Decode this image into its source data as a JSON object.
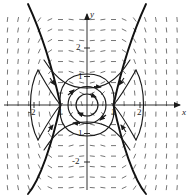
{
  "figure": {
    "width": 195,
    "height": 196,
    "background": "#ffffff",
    "ink_color": "#1a1a1a",
    "field_color": "#555555"
  },
  "axes": {
    "x_axis_label": "x",
    "y_axis_label": "y",
    "origin_px": [
      87,
      105
    ],
    "unit_px_x": 26.5,
    "unit_px_y": 28.5,
    "xlim": [
      -3.2,
      3.7
    ],
    "ylim": [
      -3.1,
      3.2
    ],
    "x_ticks": [
      {
        "value": -2,
        "label": "-2"
      },
      {
        "value": -1,
        "label": "1"
      },
      {
        "value": 1,
        "label": "1"
      },
      {
        "value": 2,
        "label": "2"
      }
    ],
    "y_ticks": [
      {
        "value": 2,
        "label": "2"
      },
      {
        "value": 1,
        "label": "1"
      },
      {
        "value": -1,
        "label": "1"
      },
      {
        "value": -2,
        "label": "-2"
      }
    ],
    "x_arrow": "right",
    "y_arrow": "up"
  },
  "chart_data": {
    "type": "scatter",
    "title": "",
    "xlabel": "x",
    "ylabel": "y",
    "xlim": [
      -3.2,
      3.7
    ],
    "ylim": [
      -3.1,
      3.2
    ],
    "grid": false,
    "legend": null,
    "plot_kind": "phase-portrait-direction-field",
    "equilibria": [
      {
        "point": [
          0,
          0
        ],
        "type": "center"
      },
      {
        "point": [
          -1,
          0
        ],
        "type": "saddle"
      },
      {
        "point": [
          1,
          0
        ],
        "type": "saddle"
      }
    ],
    "closed_orbits": [
      {
        "name": "inner-orbit",
        "rx": 0.42,
        "ry": 0.4,
        "direction": "clockwise"
      },
      {
        "name": "middle-orbit",
        "rx": 0.72,
        "ry": 0.66,
        "direction": "clockwise"
      }
    ],
    "separatrix": {
      "name": "homoclinic-loop-and-branches",
      "stroke_width": 1.6,
      "through_saddles": [
        [
          -1,
          0
        ],
        [
          1,
          0
        ]
      ]
    },
    "bold_branches": [
      {
        "name": "upper-left-branch",
        "from": [
          -3.2,
          3.2
        ],
        "to": [
          -1,
          0
        ]
      },
      {
        "name": "lower-left-branch",
        "from": [
          -3.2,
          -3.1
        ],
        "to": [
          -1,
          0
        ]
      },
      {
        "name": "upper-right-branch",
        "from": [
          3.2,
          3.2
        ],
        "to": [
          1,
          0
        ]
      },
      {
        "name": "lower-right-branch",
        "from": [
          3.2,
          -3.1
        ],
        "to": [
          1,
          0
        ]
      }
    ],
    "field": {
      "style": "dashes",
      "nx": 17,
      "ny": 17,
      "x_range": [
        -3.0,
        3.4
      ],
      "y_range": [
        -2.9,
        3.0
      ],
      "dash_length_px": 5
    },
    "flow_arrowheads": [
      {
        "at": [
          -0.55,
          0.42
        ],
        "heading": "up-right"
      },
      {
        "at": [
          0.12,
          0.72
        ],
        "heading": "right"
      },
      {
        "at": [
          0.62,
          -0.38
        ],
        "heading": "down-left"
      },
      {
        "at": [
          -0.1,
          -0.7
        ],
        "heading": "left"
      },
      {
        "at": [
          0.3,
          0.3
        ],
        "heading": "right"
      },
      {
        "at": [
          -0.3,
          -0.3
        ],
        "heading": "left"
      },
      {
        "at": [
          1.55,
          0.95
        ],
        "heading": "down-left"
      },
      {
        "at": [
          -1.55,
          0.95
        ],
        "heading": "down-right"
      }
    ]
  }
}
